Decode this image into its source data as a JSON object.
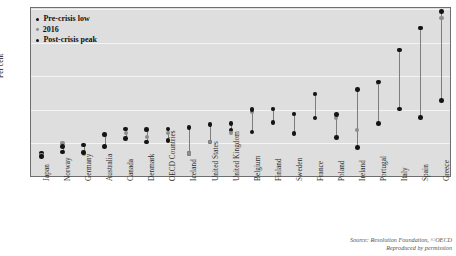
{
  "figure": {
    "title_partial": "",
    "ylabel": "Per cent",
    "source_line1": "Source: Resolution Foundation, ©OECD",
    "source_line2": "Reproduced by permission"
  },
  "legend": {
    "position": "top-left",
    "items": [
      {
        "label": "Pre-crisis low",
        "color": "#141414",
        "marker": "dot-dark"
      },
      {
        "label": "2016",
        "color": "#8d8d8d",
        "marker": "dot-mid"
      },
      {
        "label": "Post-crisis peak",
        "color": "#141414",
        "marker": "dot-dark"
      }
    ]
  },
  "colors": {
    "plot_background": "#dedede",
    "gridline": "#f4f4f4",
    "frame": "#6e6e6e",
    "dark_marker": "#141414",
    "mid_marker": "#8d8d8d",
    "connector": "#7d7d7d"
  },
  "chart_data": {
    "type": "scatter",
    "title": "",
    "xlabel": "",
    "ylabel": "Per cent",
    "ylim": [
      0,
      50
    ],
    "yticks": [
      0,
      10,
      20,
      30,
      40,
      50
    ],
    "grid": true,
    "legend_position": "top-left",
    "categories": [
      "Japan",
      "Norway",
      "Germany",
      "Australia",
      "Canada",
      "Denmark",
      "OECD Countries",
      "Iceland",
      "United States",
      "United Kingdom",
      "Belgium",
      "Finland",
      "Sweden",
      "France",
      "Poland",
      "Ireland",
      "Portugal",
      "Italy",
      "Spain",
      "Greece"
    ],
    "series": [
      {
        "name": "Pre-crisis low",
        "color": "#141414",
        "values": [
          7.2,
          7.5,
          9.5,
          9.0,
          11.5,
          10.4,
          10.8,
          7.0,
          10.4,
          14.0,
          13.4,
          16.2,
          13.0,
          17.5,
          11.8,
          8.8,
          16.0,
          20.2,
          17.7,
          22.7
        ]
      },
      {
        "name": "2016",
        "color": "#8d8d8d",
        "values": [
          6.6,
          10.0,
          6.8,
          12.5,
          13.0,
          12.0,
          13.0,
          7.0,
          10.3,
          13.0,
          19.3,
          20.2,
          18.7,
          24.6,
          17.5,
          13.9,
          28.0,
          37.8,
          44.4,
          47.3
        ]
      },
      {
        "name": "Post-crisis peak",
        "color": "#141414",
        "values": [
          6.1,
          9.0,
          7.3,
          12.7,
          14.3,
          14.2,
          14.3,
          14.8,
          15.6,
          15.9,
          20.1,
          20.2,
          18.7,
          24.7,
          18.6,
          26.0,
          28.3,
          37.8,
          44.4,
          49.3
        ]
      }
    ]
  }
}
